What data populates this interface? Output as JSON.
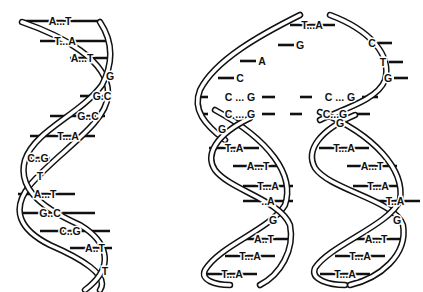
{
  "diagram": {
    "panels": [
      {
        "id": "parent-helix",
        "description": "Double-stranded DNA helix",
        "base_pairs": [
          "A...T",
          "T...A",
          "A...T",
          "G",
          "G.C",
          "G..C",
          "T...A",
          "C..G",
          "T",
          "A...T",
          "G..C",
          "C..G",
          "A..T",
          "T"
        ]
      },
      {
        "id": "replication-fork",
        "description": "Replicating DNA: parental strands separate, unpaired bases exposed",
        "fork_top": {
          "paired": [
            "T...A"
          ],
          "left_strand_bases": [
            "G",
            "A",
            "C"
          ],
          "right_strand_bases": [
            "C",
            "T",
            "G"
          ]
        },
        "fork_middle": [
          {
            "left": "C ... G",
            "right": "C ... G"
          },
          {
            "left": "C ... G",
            "right": "C...G"
          }
        ],
        "left_daughter": [
          "G",
          "T..A",
          "A...T",
          "T...A",
          "..A",
          "G",
          "A..T",
          "T...A",
          "T...A"
        ],
        "right_daughter": [
          "G",
          "T...A",
          "A...T",
          "T...A",
          "T..A",
          "G",
          "A...T",
          "T...A",
          "T...A"
        ]
      }
    ]
  }
}
